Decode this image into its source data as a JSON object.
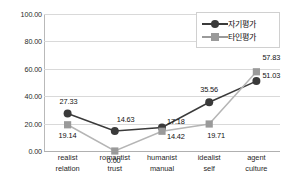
{
  "chart_data": {
    "type": "line",
    "title": "",
    "subtitle": "",
    "xlabel": "",
    "ylabel": "",
    "ylim": [
      0,
      100
    ],
    "yticks": [
      "0.00",
      "20.00",
      "40.00",
      "60.00",
      "80.00",
      "100.00"
    ],
    "ytick_values": [
      0,
      20,
      40,
      60,
      80,
      100
    ],
    "grid": true,
    "legend_position": "top-right",
    "categories": [
      {
        "line1": "realist",
        "line2": "relation"
      },
      {
        "line1": "romantist",
        "line2": "trust"
      },
      {
        "line1": "humanist",
        "line2": "manual"
      },
      {
        "line1": "idealist",
        "line2": "self"
      },
      {
        "line1": "agent",
        "line2": "culture"
      }
    ],
    "series": [
      {
        "name": "자기평가",
        "marker": "circle",
        "color": "#3a3a3a",
        "line_color": "#3a3a3a",
        "values": [
          27.33,
          14.63,
          17.18,
          35.56,
          51.03
        ],
        "labels": [
          "27.33",
          "14.63",
          "17.18",
          "35.56",
          "51.03"
        ]
      },
      {
        "name": "타인평가",
        "marker": "square",
        "color": "#9a9a9a",
        "line_color": "#b5b5b5",
        "values": [
          19.14,
          0.0,
          14.42,
          19.71,
          57.83
        ],
        "labels": [
          "19.14",
          "0.00",
          "14.42",
          "19.71",
          "57.83"
        ]
      }
    ]
  },
  "legend": {
    "items": [
      {
        "label": "자기평가",
        "marker": "circle",
        "color": "#3a3a3a"
      },
      {
        "label": "타인평가",
        "marker": "square",
        "color": "#9a9a9a"
      }
    ]
  }
}
